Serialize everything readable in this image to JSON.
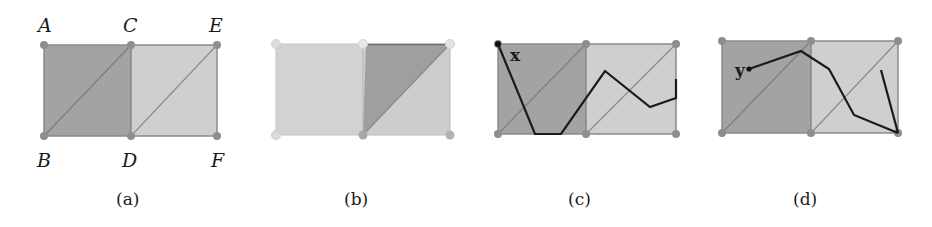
{
  "colors": {
    "dark_fill": "#a3a3a3",
    "light_fill": "#cfcfcf",
    "very_light_fill": "#d4d4d4",
    "edge": "#8a8a8a",
    "vertex": "#8e8e8e",
    "vertex_faded": "#d9d9d9",
    "path": "#1a1a1a"
  },
  "panels": [
    {
      "id": "a",
      "caption": "(a)",
      "vertex_labels": {
        "A": "A",
        "B": "B",
        "C": "C",
        "D": "D",
        "E": "E",
        "F": "F"
      },
      "description": "Two squares ABDC (dark) and CDFE (light), each split by diagonal from bottom-left to top-right"
    },
    {
      "id": "b",
      "caption": "(b)",
      "description": "Left square light; right square upper-left triangle highlighted dark"
    },
    {
      "id": "c",
      "caption": "(c)",
      "point_label": "x",
      "path": [
        [
          498,
          44
        ],
        [
          535,
          134
        ],
        [
          561,
          134
        ],
        [
          605,
          71
        ],
        [
          650,
          107
        ],
        [
          676,
          98
        ],
        [
          676,
          79
        ]
      ]
    },
    {
      "id": "d",
      "caption": "(d)",
      "point_label": "y",
      "path": [
        [
          749,
          69
        ],
        [
          801,
          51
        ],
        [
          829,
          69
        ],
        [
          854,
          115
        ],
        [
          898,
          133
        ]
      ],
      "extra_segment": [
        [
          881,
          70
        ],
        [
          898,
          133
        ]
      ]
    }
  ]
}
